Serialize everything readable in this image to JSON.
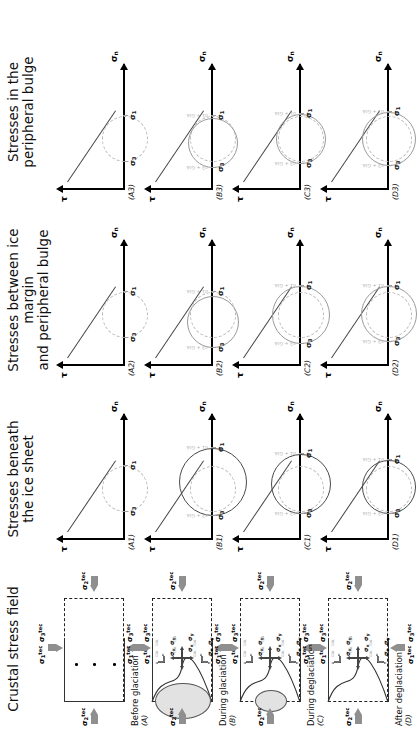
{
  "figure": {
    "orientation": "rotated-90",
    "columns": [
      {
        "id": "crustal",
        "title": "Crustal stress field"
      },
      {
        "id": "beneath",
        "title_line1": "Stresses beneath",
        "title_line2": "the ice sheet"
      },
      {
        "id": "between",
        "title_line1": "Stresses between ice margin",
        "title_line2": "and peripheral bulge"
      },
      {
        "id": "bulge",
        "title_line1": "Stresses in the",
        "title_line2": "peripheral bulge"
      }
    ],
    "rows": [
      {
        "key": "A",
        "stage": "Before glaciation",
        "panel_id": "(A)"
      },
      {
        "key": "B",
        "stage": "During glaciation",
        "panel_id": "(B)"
      },
      {
        "key": "C",
        "stage": "During deglaciation",
        "panel_id": "(C)"
      },
      {
        "key": "D",
        "stage": "After deglaciation",
        "panel_id": "(D)"
      }
    ]
  },
  "mohr": {
    "axis_x_label": "σ",
    "axis_x_sub": "n",
    "axis_y_label": "τ",
    "sigma1": "σ",
    "sigma1_sub": "1",
    "sigma3": "σ",
    "sigma3_sub": "3",
    "gia_label_s1": "σ1 + GIA",
    "gia_label_s3": "σ3 + GIA",
    "panels": [
      {
        "id": "(A1)",
        "col": "beneath",
        "row": "A",
        "circles": [
          {
            "style": "dash",
            "x1": 28,
            "x2": 74
          }
        ]
      },
      {
        "id": "(A2)",
        "col": "between",
        "row": "A",
        "circles": [
          {
            "style": "dash",
            "x1": 28,
            "x2": 74
          }
        ]
      },
      {
        "id": "(A3)",
        "col": "bulge",
        "row": "A",
        "circles": [
          {
            "style": "dash",
            "x1": 28,
            "x2": 74
          }
        ]
      },
      {
        "id": "(B1)",
        "col": "beneath",
        "row": "B",
        "circles": [
          {
            "style": "dash",
            "x1": 28,
            "x2": 74
          },
          {
            "style": "solid-dark",
            "x1": 24,
            "x2": 92
          }
        ]
      },
      {
        "id": "(B2)",
        "col": "between",
        "row": "B",
        "circles": [
          {
            "style": "dash",
            "x1": 28,
            "x2": 74
          },
          {
            "style": "solid-gray",
            "x1": 18,
            "x2": 70
          }
        ]
      },
      {
        "id": "(B3)",
        "col": "bulge",
        "row": "B",
        "circles": [
          {
            "style": "dash",
            "x1": 28,
            "x2": 74
          },
          {
            "style": "solid-gray",
            "x1": 22,
            "x2": 72
          }
        ]
      },
      {
        "id": "(C1)",
        "col": "beneath",
        "row": "C",
        "circles": [
          {
            "style": "dash",
            "x1": 28,
            "x2": 74
          },
          {
            "style": "solid-dark",
            "x1": 26,
            "x2": 86
          }
        ]
      },
      {
        "id": "(C2)",
        "col": "between",
        "row": "C",
        "circles": [
          {
            "style": "dash",
            "x1": 28,
            "x2": 74
          },
          {
            "style": "solid-gray",
            "x1": 22,
            "x2": 80
          }
        ]
      },
      {
        "id": "(C3)",
        "col": "bulge",
        "row": "C",
        "circles": [
          {
            "style": "dash",
            "x1": 28,
            "x2": 74
          },
          {
            "style": "solid-gray",
            "x1": 26,
            "x2": 76
          }
        ]
      },
      {
        "id": "(D1)",
        "col": "beneath",
        "row": "D",
        "circles": [
          {
            "style": "dash",
            "x1": 28,
            "x2": 74
          },
          {
            "style": "solid-dark",
            "x1": 26,
            "x2": 80
          }
        ]
      },
      {
        "id": "(D2)",
        "col": "between",
        "row": "D",
        "circles": [
          {
            "style": "dash",
            "x1": 28,
            "x2": 74
          },
          {
            "style": "solid-gray",
            "x1": 24,
            "x2": 80
          }
        ]
      },
      {
        "id": "(D3)",
        "col": "bulge",
        "row": "D",
        "circles": [
          {
            "style": "dash",
            "x1": 28,
            "x2": 74
          },
          {
            "style": "solid-gray",
            "x1": 24,
            "x2": 78
          }
        ]
      }
    ]
  },
  "crustal": {
    "title": "Crustal stress field",
    "axis_stress_labels": {
      "top_left": "σ1",
      "top_right": "σ3",
      "left": "σ2",
      "right": "σ2",
      "bottom_left": "σ1",
      "bottom_right": "σ3"
    },
    "tec_sup": "tec",
    "local_labels": {
      "x": "σx",
      "y": "σy",
      "gia": "GIA"
    },
    "panels": [
      {
        "id": "(A)",
        "stage": "Before glaciation",
        "has_ice": false,
        "clusters": 3,
        "deformed": false
      },
      {
        "id": "(B)",
        "stage": "During glaciation",
        "has_ice": true,
        "clusters": 3,
        "deformed": true
      },
      {
        "id": "(C)",
        "stage": "During deglaciation",
        "has_ice": true,
        "clusters": 3,
        "deformed": true
      },
      {
        "id": "(D)",
        "stage": "After deglaciation",
        "has_ice": false,
        "clusters": 3,
        "deformed": true
      }
    ]
  }
}
